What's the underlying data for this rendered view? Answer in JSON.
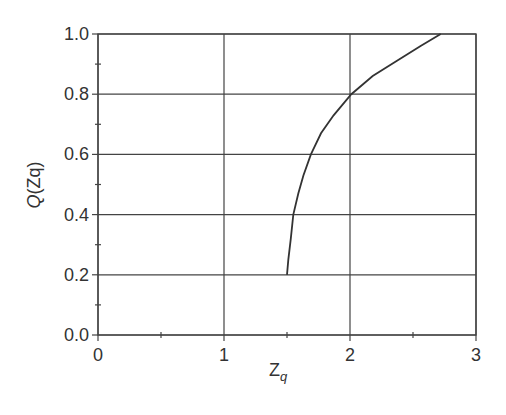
{
  "chart_data": {
    "type": "line",
    "title": "",
    "xlabel": "Z",
    "xlabel_subscript": "q",
    "ylabel": "Q(Zq)",
    "xlim": [
      0,
      3
    ],
    "ylim": [
      0.0,
      1.0
    ],
    "x_ticks": [
      "0",
      "1",
      "2",
      "3"
    ],
    "y_ticks": [
      "0.0",
      "0.2",
      "0.4",
      "0.6",
      "0.8",
      "1.0"
    ],
    "grid": true,
    "legend": null,
    "series": [
      {
        "name": "Q(Zq)",
        "x": [
          1.5,
          1.51,
          1.53,
          1.55,
          1.59,
          1.63,
          1.69,
          1.77,
          1.87,
          2.01,
          2.18,
          2.37,
          2.56,
          2.72
        ],
        "y": [
          0.2,
          0.25,
          0.32,
          0.4,
          0.47,
          0.53,
          0.6,
          0.67,
          0.73,
          0.8,
          0.86,
          0.91,
          0.96,
          1.0
        ]
      }
    ]
  }
}
